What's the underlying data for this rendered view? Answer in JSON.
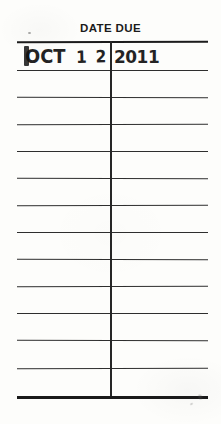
{
  "card": {
    "title": "DATE DUE",
    "background_color": "#fdfdfb",
    "ink_color": "#1c1c1c",
    "width": 221,
    "height": 424
  },
  "grid": {
    "left": 17,
    "right": 208,
    "divider_x": 110,
    "divider_top": 41,
    "divider_bottom": 396,
    "row_lines_y": [
      41,
      70,
      97,
      124,
      151,
      178,
      205,
      232,
      259,
      286,
      313,
      340,
      368,
      396
    ],
    "row_count": 13
  },
  "stamps": [
    {
      "row": 1,
      "month": "OCT",
      "day": "1 2",
      "year": "2011",
      "full_text": "OCT 12 2011"
    }
  ],
  "marks": {
    "top_left_speck": "ink-speck",
    "bottom_right_smudge": "ink-smudge"
  }
}
